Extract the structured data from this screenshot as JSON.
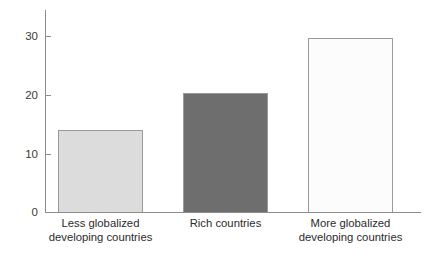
{
  "chart_data": {
    "type": "bar",
    "title": "",
    "xlabel": "",
    "ylabel": "",
    "categories": [
      "Less globalized\ndeveloping countries",
      "Rich countries",
      "More globalized\ndeveloping countries"
    ],
    "values": [
      14,
      20.2,
      29.7
    ],
    "bar_colors": [
      "#dcdcdc",
      "#6e6e6e",
      "#fcfcfc"
    ],
    "bar_border_color": "#9a9a9a",
    "ylim": [
      0,
      34.5
    ],
    "yticks": [
      0,
      10,
      20,
      30
    ],
    "ytick_labels": [
      "0",
      "10",
      "20",
      "30"
    ],
    "grid": false,
    "legend": false,
    "axis_color": "#8c8c8c"
  },
  "axis": {
    "tick_0": "0",
    "tick_10": "10",
    "tick_20": "20",
    "tick_30": "30"
  },
  "bars": {
    "bar1_label": "Less globalized\ndeveloping countries",
    "bar2_label": "Rich countries",
    "bar3_label": "More globalized\ndeveloping countries"
  }
}
